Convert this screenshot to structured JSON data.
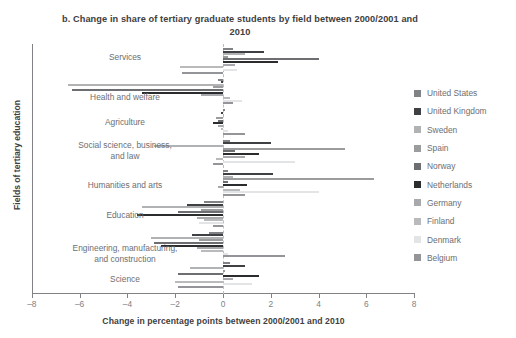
{
  "chart_data": {
    "type": "bar",
    "orientation": "horizontal",
    "title": "b. Change in share of tertiary graduate students by field between 2000/2001 and 2010",
    "xlabel": "Change in percentage points between 2000/2001 and 2010",
    "ylabel": "Fields of tertiary education",
    "xlim": [
      -8,
      8
    ],
    "xticks": [
      -8,
      -6,
      -4,
      -2,
      0,
      2,
      4,
      6,
      8
    ],
    "xticklabels": [
      "–8",
      "–6",
      "–4",
      "–2",
      "0",
      "2",
      "4",
      "6",
      "8"
    ],
    "grid": false,
    "legend_position": "right",
    "zero_reference_line": true,
    "categories": [
      "Services",
      "Health and welfare",
      "Agriculture",
      "Social science, business,\nand law",
      "Humanities and arts",
      "Education",
      "Engineering, manufacturing,\nand construction",
      "Science"
    ],
    "series": [
      {
        "name": "United States",
        "color": "#808285",
        "values": [
          0.4,
          -0.2,
          0.1,
          0.3,
          0.2,
          -0.8,
          -0.6,
          0.3
        ]
      },
      {
        "name": "United Kingdom",
        "color": "#3f4043",
        "values": [
          1.7,
          -0.1,
          -0.1,
          2.0,
          2.1,
          -1.5,
          -1.3,
          0.9
        ]
      },
      {
        "name": "Sweden",
        "color": "#b0b2b4",
        "values": [
          0.9,
          -6.5,
          0.0,
          -2.9,
          0.4,
          -3.4,
          -3.0,
          -1.4
        ]
      },
      {
        "name": "Spain",
        "color": "#9a9c9e",
        "values": [
          0.2,
          -0.4,
          -0.3,
          5.1,
          6.3,
          -0.9,
          -1.0,
          0.1
        ]
      },
      {
        "name": "Norway",
        "color": "#6d6e71",
        "values": [
          4.0,
          -6.3,
          -0.2,
          0.5,
          0.2,
          -1.9,
          -2.9,
          -1.9
        ]
      },
      {
        "name": "Netherlands",
        "color": "#2b2c2e",
        "values": [
          2.3,
          -3.4,
          -0.4,
          1.5,
          1.0,
          -3.6,
          -2.6,
          1.5
        ]
      },
      {
        "name": "Germany",
        "color": "#a7a9ac",
        "values": [
          0.5,
          -0.9,
          -0.2,
          0.9,
          -0.2,
          -1.1,
          -1.1,
          0.4
        ]
      },
      {
        "name": "Finland",
        "color": "#b8babc",
        "values": [
          -1.8,
          0.3,
          -0.1,
          -0.3,
          0.7,
          -0.8,
          -0.9,
          -2.0
        ]
      },
      {
        "name": "Denmark",
        "color": "#e3e4e5",
        "values": [
          0.6,
          0.8,
          0.2,
          3.0,
          4.0,
          -1.0,
          0.2,
          1.2
        ]
      },
      {
        "name": "Belgium",
        "color": "#939598",
        "values": [
          -1.7,
          0.4,
          0.9,
          -0.4,
          0.9,
          -0.4,
          2.6,
          -1.9
        ]
      }
    ]
  },
  "legend": {
    "items": [
      {
        "label": "United States"
      },
      {
        "label": "United Kingdom"
      },
      {
        "label": "Sweden"
      },
      {
        "label": "Spain"
      },
      {
        "label": "Norway"
      },
      {
        "label": "Netherlands"
      },
      {
        "label": "Germany"
      },
      {
        "label": "Finland"
      },
      {
        "label": "Denmark"
      },
      {
        "label": "Belgium"
      }
    ]
  }
}
